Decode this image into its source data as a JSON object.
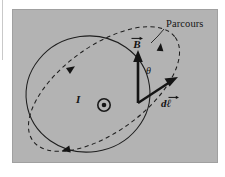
{
  "figure": {
    "kind": "physics-diagram",
    "topic": "ampere-law-circulation",
    "background_color": "#b3b3b3",
    "page_color": "#ffffff",
    "stroke_color": "#1a1a1a"
  },
  "labels": {
    "path_label": "Parcours",
    "current_label": "I",
    "current_direction_icon": "dot-out-of-page-icon",
    "angle_label": "θ",
    "b_field_label": "B",
    "dl_label": "dℓ",
    "vector_accent": "→"
  },
  "elements": {
    "field_line": {
      "name": "magnetic-field-line-circle",
      "style": "solid",
      "arrowheads": 1
    },
    "integration_path": {
      "name": "amperian-loop-ellipse",
      "style": "dashed",
      "arrowheads": 3
    },
    "b_vector": {
      "name": "b-field-vector",
      "style": "solid-arrow",
      "direction": "up"
    },
    "dl_vector": {
      "name": "dl-path-element-vector",
      "style": "solid-arrow",
      "direction": "up-right"
    },
    "leader_line": {
      "name": "parcours-leader-line",
      "style": "solid-thin"
    }
  }
}
